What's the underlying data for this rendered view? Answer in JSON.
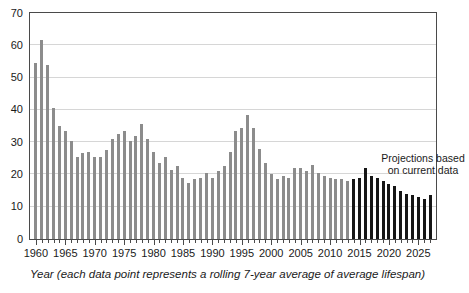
{
  "chart": {
    "type": "bar",
    "title": "",
    "annotation": {
      "line1": "Projections based",
      "line2": "on current data"
    },
    "xlabel": "Year (each data point represents a rolling 7-year average of average lifespan)",
    "ylabel": ""
  },
  "chart_data": {
    "type": "bar",
    "title": "",
    "xlabel": "Year (each data point represents a rolling 7-year average of average lifespan)",
    "ylabel": "",
    "xlim": [
      1959,
      2028
    ],
    "ylim": [
      0,
      70
    ],
    "y_ticks": [
      0,
      10,
      20,
      30,
      40,
      50,
      60,
      70
    ],
    "x_ticks": [
      1960,
      1965,
      1970,
      1975,
      1980,
      1985,
      1990,
      1995,
      2000,
      2005,
      2010,
      2015,
      2020,
      2025
    ],
    "grid": true,
    "legend": false,
    "annotations": [
      {
        "text": "Projections based on current data",
        "x": 2021,
        "y": 28
      }
    ],
    "series": [
      {
        "name": "Historic (rolling 7-year average of average lifespan)",
        "color": "#8c8c8c",
        "categories": [
          1960,
          1961,
          1962,
          1963,
          1964,
          1965,
          1966,
          1967,
          1968,
          1969,
          1970,
          1971,
          1972,
          1973,
          1974,
          1975,
          1976,
          1977,
          1978,
          1979,
          1980,
          1981,
          1982,
          1983,
          1984,
          1985,
          1986,
          1987,
          1988,
          1989,
          1990,
          1991,
          1992,
          1993,
          1994,
          1995,
          1996,
          1997,
          1998,
          1999,
          2000,
          2001,
          2002,
          2003,
          2004,
          2005,
          2006,
          2007,
          2008,
          2009,
          2010,
          2011,
          2012,
          2013
        ],
        "values": [
          54.5,
          61.5,
          54.0,
          40.5,
          35.0,
          33.5,
          30.5,
          25.5,
          26.5,
          27.0,
          25.5,
          25.5,
          27.5,
          31.0,
          32.5,
          33.5,
          30.5,
          32.0,
          35.5,
          31.0,
          27.0,
          23.5,
          25.5,
          21.5,
          22.5,
          19.0,
          17.5,
          18.5,
          19.0,
          20.5,
          19.0,
          21.0,
          22.5,
          27.0,
          33.5,
          34.5,
          38.5,
          34.5,
          28.0,
          23.5,
          20.0,
          18.5,
          19.5,
          19.0,
          22.0,
          22.0,
          21.0,
          23.0,
          20.5,
          19.5,
          19.0,
          18.5,
          18.5,
          18.0
        ]
      },
      {
        "name": "Projections based on current data",
        "color": "#161616",
        "categories": [
          2014,
          2015,
          2016,
          2017,
          2018,
          2019,
          2020,
          2021,
          2022,
          2023,
          2024,
          2025,
          2026,
          2027
        ],
        "values": [
          18.5,
          19.0,
          22.0,
          19.5,
          19.0,
          18.0,
          17.0,
          16.5,
          15.0,
          14.0,
          13.5,
          13.0,
          12.5,
          13.5
        ]
      }
    ]
  }
}
